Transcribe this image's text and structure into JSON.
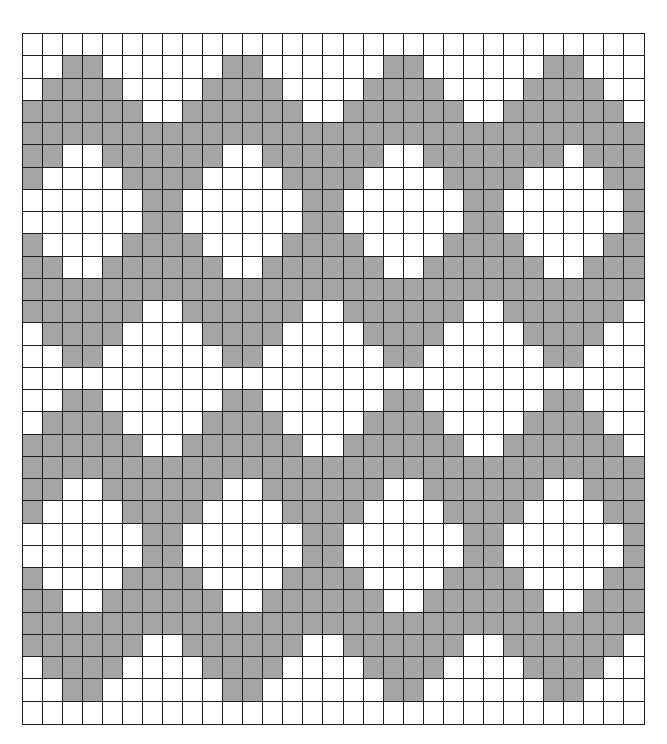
{
  "pattern_chart": {
    "columns": 31,
    "rows": 31,
    "colors": {
      "filled": "#a5a5a5",
      "empty": "#ffffff",
      "grid_line": "#1e1e1e"
    },
    "cells": [
      "0000000000000000000000000000000",
      "0011000000110000001100000011000",
      "0111100001111000011110000111100",
      "1111110011111100111111001111110",
      "1111111111111111111111111111111",
      "1100111111001111110011111110111",
      "1000011110000111100001111000011",
      "0000001100000011000000110000001",
      "0000001100000011000000110000001",
      "1000011110000111100001111000011",
      "1100111111001111110011111100111",
      "1111111111111111111111111111111",
      "1111110011111100111111001111110",
      "0111100001111000011110000111100",
      "0011000000110000001100000011000",
      "0000000000000000000000000000000",
      "0011000000110000001100000011000",
      "0111100001111000011110000111100",
      "1111110011111100111111001111110",
      "1111111111111111111111111111111",
      "1100111111001111110011111100111",
      "1000011110000111100001111000011",
      "0000001100000011000000110000001",
      "0000001100000011000000110000001",
      "1000011110000111100001111000011",
      "1100111111001111110011111100111",
      "1111111111111111111111111111111",
      "1111110011111100111111001111110",
      "0111100001111000011110000111100",
      "0011000000110000001100000011000",
      "0000000000000000000000000000000"
    ]
  }
}
